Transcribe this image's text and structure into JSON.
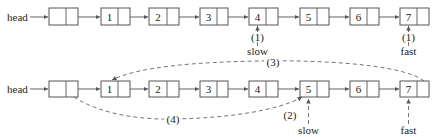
{
  "diagram": {
    "head_label": "head",
    "nodes": [
      "",
      "1",
      "2",
      "3",
      "4",
      "5",
      "6",
      "7"
    ],
    "rows": [
      {
        "id": "row1",
        "pointers": [
          {
            "name": "slow",
            "step": "(1)",
            "target_node": "4"
          },
          {
            "name": "fast",
            "step": "(1)",
            "target_node": "7"
          }
        ]
      },
      {
        "id": "row2",
        "pointers": [
          {
            "name": "slow",
            "step": "(2)",
            "target_node": "5"
          },
          {
            "name": "fast",
            "step": "",
            "target_node": "7"
          }
        ],
        "links": [
          {
            "step": "(3)",
            "from": "7",
            "to": "1",
            "style": "dashed"
          },
          {
            "step": "(4)",
            "from": "head-sentinel",
            "to": "5",
            "style": "dashed"
          }
        ]
      }
    ],
    "colors": {
      "stroke": "#555555",
      "text": "#222222",
      "background": "#ffffff"
    }
  }
}
